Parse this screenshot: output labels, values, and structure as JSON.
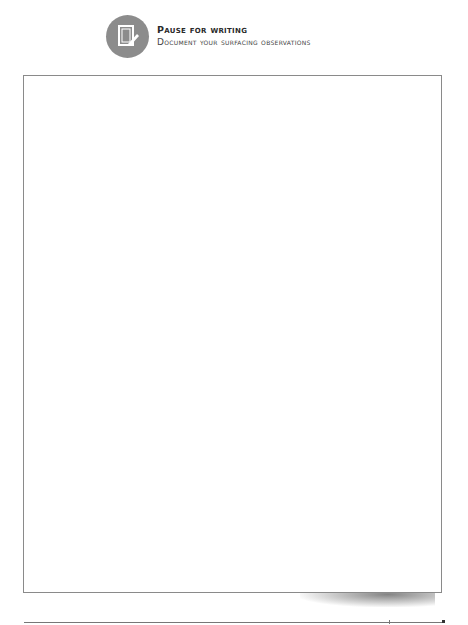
{
  "header": {
    "icon": "pencil-paper-icon",
    "title": "Pause for writing",
    "subtitle": "Document your surfacing observations"
  },
  "writing_area": {
    "content": ""
  },
  "colors": {
    "icon_circle": "#8c8c8c",
    "border": "#8a8a8a",
    "title": "#2a2a2a"
  }
}
